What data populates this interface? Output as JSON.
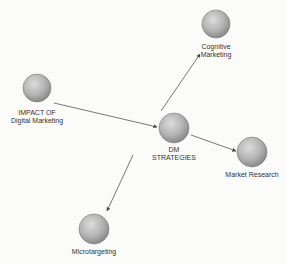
{
  "diagram": {
    "type": "concept-map",
    "colors": {
      "background": "#fbfbfa",
      "node_fill_light": "#d0d0d0",
      "node_fill_dark": "#8f8f8f",
      "edge": "#555555",
      "label": "#333333"
    },
    "nodes": [
      {
        "id": "impact",
        "line1": "IMPACT OF",
        "line2": "Digital Marketing",
        "cx": 37,
        "cy": 88,
        "r": 14,
        "label_y": 109
      },
      {
        "id": "dm",
        "line1": "DM",
        "line2": "STRATEGIES",
        "cx": 174,
        "cy": 128,
        "r": 15,
        "label_y": 146
      },
      {
        "id": "cognitive",
        "line1": "Cognitive",
        "line2": "Marketing",
        "cx": 216,
        "cy": 24,
        "r": 14,
        "label_y": 43
      },
      {
        "id": "market",
        "line1": "Market Research",
        "line2": "",
        "cx": 252,
        "cy": 152,
        "r": 15,
        "label_y": 171
      },
      {
        "id": "micro",
        "line1": "Microtargeting",
        "line2": "",
        "cx": 94,
        "cy": 229,
        "r": 15,
        "label_y": 248
      }
    ],
    "edges": [
      {
        "from": "impact",
        "to": "dm",
        "x1": 54,
        "y1": 103,
        "x2": 157,
        "y2": 127
      },
      {
        "from": "dm",
        "to": "cognitive",
        "x1": 161,
        "y1": 111,
        "x2": 200,
        "y2": 54
      },
      {
        "from": "dm",
        "to": "market",
        "x1": 191,
        "y1": 135,
        "x2": 236,
        "y2": 151
      },
      {
        "from": "dm",
        "to": "micro",
        "x1": 133,
        "y1": 155,
        "x2": 107,
        "y2": 211
      }
    ]
  }
}
